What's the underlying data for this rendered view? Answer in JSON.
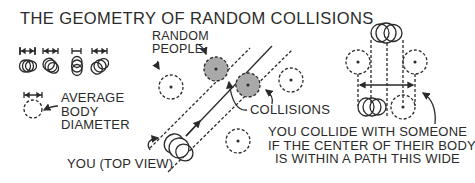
{
  "title": "THE GEOMETRY OF RANDOM COLLISIONS",
  "labels": {
    "random_people": [
      "RANDOM",
      "PEOPLE"
    ],
    "average_body_diameter": [
      "AVERAGE",
      "BODY",
      "DIAMETER"
    ],
    "you_top_view": "YOU (TOP VIEW)",
    "collisions": "COLLISIONS",
    "explanation": [
      "YOU COLLIDE WITH SOMEONE",
      "IF THE CENTER OF THEIR BODY",
      "IS WITHIN A PATH THIS WIDE"
    ]
  },
  "colors": {
    "ink": "#2a2a2a",
    "collision_fill": "#a9a9a9",
    "background": "#ffffff"
  },
  "icons": [
    "width-marker-icon",
    "body-top-view-icon",
    "dashed-circle-icon",
    "arrow-icon"
  ]
}
